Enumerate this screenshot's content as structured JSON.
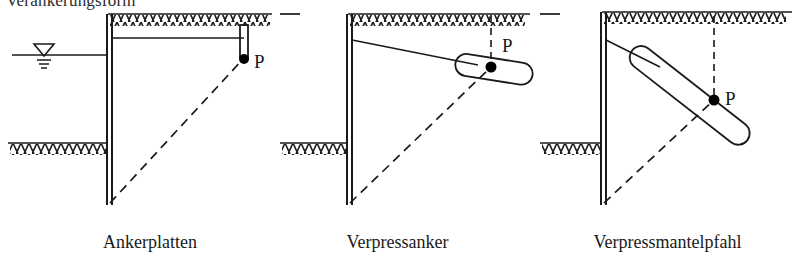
{
  "figure": {
    "caption_top": "Verankerungsform",
    "panels": [
      {
        "id": "ankerplatten",
        "label": "Ankerplatten",
        "point_label": "P",
        "anchor_type": "anchor-plate",
        "has_water_table": true,
        "has_tie_rod": true
      },
      {
        "id": "verpressanker",
        "label": "Verpressanker",
        "point_label": "P",
        "anchor_type": "grouted-anchor",
        "has_water_table": false,
        "has_tie_rod": true
      },
      {
        "id": "verpressmantelpfahl",
        "label": "Verpressmantelpfahl",
        "point_label": "P",
        "anchor_type": "grouted-shaft-pile",
        "has_water_table": false,
        "has_tie_rod": true
      }
    ],
    "colors": {
      "line": "#1a1a1a",
      "background": "#ffffff",
      "point_fill": "#000000"
    }
  }
}
